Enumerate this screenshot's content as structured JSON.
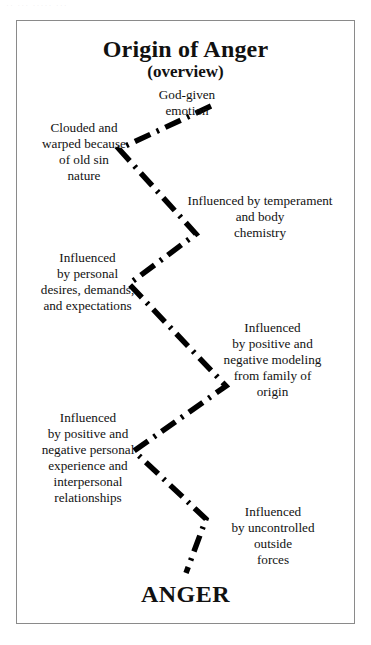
{
  "page": {
    "scan_top_remnant": "·· ··· ····· ···",
    "background_color": "#ffffff",
    "border_color": "#8a8a8a",
    "text_color": "#111111"
  },
  "diagram": {
    "title": "Origin of Anger",
    "subtitle": "(overview)",
    "line_style": "dash-dot",
    "line_color": "#000000",
    "outcome_label": "ANGER",
    "nodes": [
      {
        "id": "god-given",
        "side": "center",
        "text": "God-given\nemotion"
      },
      {
        "id": "clouded",
        "side": "left",
        "text": "Clouded and\nwarped because\nof old sin\nnature"
      },
      {
        "id": "temperament",
        "side": "right",
        "text": "Influenced by temperament\nand body\nchemistry"
      },
      {
        "id": "personal-desires",
        "side": "left",
        "text": "Influenced\nby personal\ndesires, demands,\nand expectations"
      },
      {
        "id": "family-modeling",
        "side": "right",
        "text": "Influenced\nby positive and\nnegative modeling\nfrom family of\norigin"
      },
      {
        "id": "personal-exp",
        "side": "left",
        "text": "Influenced\nby positive and\nnegative personal\nexperience and\ninterpersonal\nrelationships"
      },
      {
        "id": "outside-forces",
        "side": "right",
        "text": "Influenced\nby uncontrolled\noutside\nforces"
      }
    ]
  },
  "chart_data": {
    "type": "diagram",
    "title": "Origin of Anger (overview)",
    "subtitle": "(overview)",
    "vertices": [
      {
        "x": 210,
        "y": 105,
        "label": "God-given emotion"
      },
      {
        "x": 118,
        "y": 148,
        "label": "Clouded and warped because of old sin nature"
      },
      {
        "x": 195,
        "y": 233,
        "label": "Influenced by temperament and body chemistry"
      },
      {
        "x": 128,
        "y": 283,
        "label": "Influenced by personal desires, demands, and expectations"
      },
      {
        "x": 225,
        "y": 385,
        "label": "Influenced by positive and negative modeling from family of origin"
      },
      {
        "x": 133,
        "y": 450,
        "label": "Influenced by positive and negative personal experience and interpersonal relationships"
      },
      {
        "x": 205,
        "y": 518,
        "label": "Influenced by uncontrolled outside forces"
      },
      {
        "x": 185,
        "y": 572,
        "label": "ANGER"
      }
    ],
    "legend": [],
    "grid": false
  }
}
